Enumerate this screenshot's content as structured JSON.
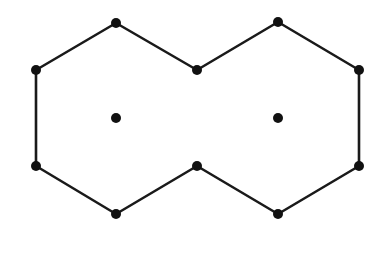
{
  "diagram": {
    "stroke_color": "#1a1a1a",
    "dot_color": "#111111",
    "outline_vertices": [
      [
        116,
        23
      ],
      [
        197,
        70
      ],
      [
        278,
        22
      ],
      [
        359,
        70
      ],
      [
        359,
        166
      ],
      [
        278,
        214
      ],
      [
        197,
        166
      ],
      [
        116,
        214
      ],
      [
        36,
        166
      ],
      [
        36,
        70
      ]
    ],
    "center_points": [
      [
        116,
        118
      ],
      [
        278,
        118
      ]
    ]
  }
}
